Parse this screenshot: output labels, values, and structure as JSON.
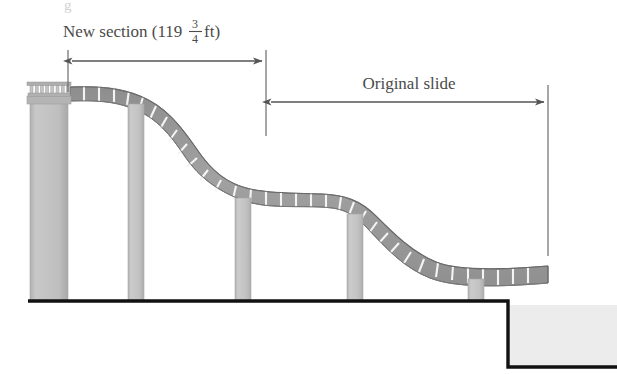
{
  "figure": {
    "title_alt": "Cross-section diagram of a playground slide showing a new section added to the original slide",
    "background_color": "#ffffff"
  },
  "annotations": {
    "new_section": {
      "label_prefix": "New section (119",
      "fraction_numerator": "3",
      "fraction_denominator": "4",
      "label_suffix": " ft)",
      "full_text": "New section (119 3/4 ft)",
      "value": "119.75",
      "unit": "ft"
    },
    "original_slide": {
      "label": "Original slide"
    },
    "partial_top_glyph": "g"
  },
  "colors": {
    "slide_segment": "#9a9a9a",
    "slide_segment_dark": "#8a8a8a",
    "slide_edge": "#6e6e6e",
    "segment_divider": "#f2f2f2",
    "column": "#c0c0c0",
    "column_edge": "#a8a8a8",
    "tower": "#bdbdbd",
    "railing": "#b5b5b5",
    "ground_line": "#111111",
    "ground_fill": "#ececec",
    "dimension_line": "#555555",
    "text": "#4a4a4a"
  },
  "structure": {
    "ground_line_label": "ground-line",
    "step_label": "ground-step",
    "tower_label": "left-tower",
    "railing_balusters": 8,
    "support_columns": 5,
    "slide_segments": 34
  }
}
